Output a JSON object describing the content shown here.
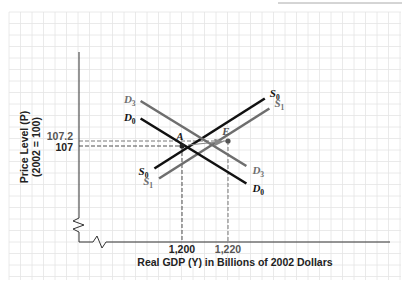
{
  "chart_data": {
    "type": "line",
    "title": "",
    "xlabel": "Real GDP (Y) in Billions of 2002 Dollars",
    "ylabel": "Price Level (P)",
    "ylabel_sub": "(2002 = 100)",
    "x_ticks": [
      {
        "value": 1200,
        "label": "1,200",
        "color": "#222222"
      },
      {
        "value": 1220,
        "label": "1,220",
        "color": "#555555"
      }
    ],
    "y_ticks": [
      {
        "value": 107.2,
        "label": "107.2",
        "color": "#555555"
      },
      {
        "value": 107,
        "label": "107",
        "color": "#222222"
      }
    ],
    "grid": true,
    "axis_breaks": {
      "x": true,
      "y": true
    },
    "series": [
      {
        "name": "S0",
        "label_main": "S",
        "label_sub": "0",
        "kind": "supply",
        "color": "#111111",
        "points": [
          [
            1188,
            106.1
          ],
          [
            1236,
            108.9
          ]
        ],
        "label_ends": [
          "start",
          "end"
        ]
      },
      {
        "name": "S1",
        "label_main": "S",
        "label_sub": "1",
        "kind": "supply",
        "color": "#6e6e6e",
        "points": [
          [
            1190,
            105.7
          ],
          [
            1238,
            108.5
          ]
        ],
        "label_ends": [
          "start",
          "end"
        ]
      },
      {
        "name": "D0",
        "label_main": "D",
        "label_sub": "0",
        "kind": "demand",
        "color": "#111111",
        "points": [
          [
            1182,
            108.1
          ],
          [
            1228,
            105.5
          ]
        ],
        "label_ends": [
          "start",
          "end"
        ]
      },
      {
        "name": "D3",
        "label_main": "D",
        "label_sub": "3",
        "kind": "demand",
        "color": "#6e6e6e",
        "points": [
          [
            1182,
            108.8
          ],
          [
            1228,
            106.2
          ]
        ],
        "label_ends": [
          "start",
          "end"
        ]
      }
    ],
    "points_of_interest": [
      {
        "name": "A",
        "x": 1200,
        "y": 107,
        "color": "#222222"
      },
      {
        "name": "E",
        "x": 1220,
        "y": 107.2,
        "color": "#555555"
      }
    ],
    "annotations": [
      {
        "type": "arrow",
        "from": "A",
        "to": "E",
        "color": "#888888"
      }
    ]
  }
}
